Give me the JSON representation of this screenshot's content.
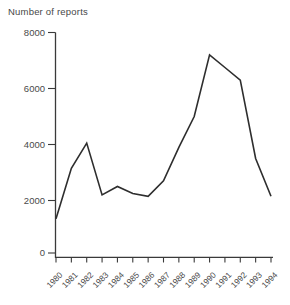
{
  "chart_data": {
    "type": "line",
    "title": "Number of reports",
    "title_position": "top-left",
    "xlabel": "",
    "ylabel": "Number of reports",
    "x": [
      1980,
      1981,
      1982,
      1983,
      1984,
      1985,
      1986,
      1987,
      1988,
      1989,
      1990,
      1991,
      1992,
      1993,
      1994
    ],
    "values": [
      1350,
      3150,
      4050,
      2200,
      2500,
      2250,
      2150,
      2700,
      3900,
      5000,
      7200,
      6750,
      6300,
      3500,
      2150
    ],
    "ylim": [
      0,
      8000
    ],
    "yticks": [
      0,
      2000,
      4000,
      6000,
      8000
    ],
    "xtick_rotation_deg": -45,
    "grid": false,
    "legend": "none",
    "colors": {
      "line": "#2e2e2e",
      "axis": "#3a3a3a",
      "tick_text": "#4a4a4a",
      "background": "#ffffff"
    }
  }
}
